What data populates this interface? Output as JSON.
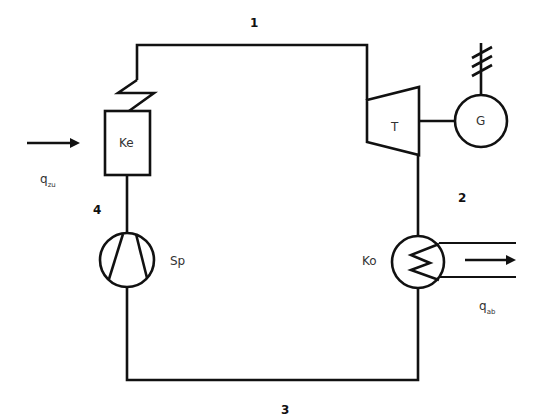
{
  "diagram": {
    "type": "rankine-cycle-process-schematic",
    "state_points": [
      "1",
      "2",
      "3",
      "4"
    ],
    "components": {
      "boiler": {
        "label": "Ke"
      },
      "turbine": {
        "label": "T"
      },
      "generator": {
        "label": "G"
      },
      "condenser": {
        "label": "Ko"
      },
      "pump": {
        "label": "Sp"
      }
    },
    "heat_in": {
      "symbol": "q",
      "subscript": "zu"
    },
    "heat_out": {
      "symbol": "q",
      "subscript": "ab"
    },
    "colors": {
      "line": "#111111",
      "text": "#333333",
      "background": "#ffffff"
    }
  }
}
